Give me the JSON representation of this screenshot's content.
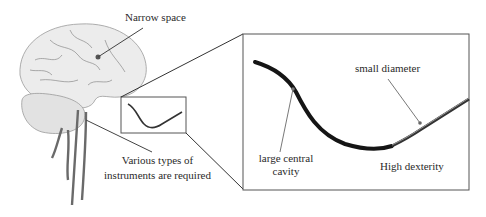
{
  "figure": {
    "labels": {
      "narrow_space": "Narrow space",
      "instruments_line1": "Various types of",
      "instruments_line2": "instruments are required",
      "small_diameter": "small diameter",
      "cavity_line1": "large central",
      "cavity_line2": "cavity",
      "high_dexterity": "High dexterity"
    },
    "panels": {
      "left": "brain-with-vessels-illustration",
      "right": "magnified-continuum-instrument"
    },
    "colors": {
      "line": "#333333",
      "instrument": "#1a1a1a",
      "brain_fill": "#e6e6e6",
      "vessel": "#7a7a7a",
      "box": "#555555"
    }
  }
}
